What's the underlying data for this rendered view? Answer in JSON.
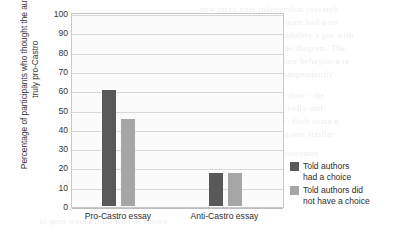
{
  "chart_data": {
    "type": "bar",
    "title": "",
    "subtitle": "",
    "categories": [
      "Pro-Castro essay",
      "Anti-Castro essay"
    ],
    "series": [
      {
        "name": "Told authors\nhad a choice",
        "values": [
          60,
          17
        ],
        "color": "#595959"
      },
      {
        "name": "Told authors did\nnot have a choice",
        "values": [
          45,
          17
        ],
        "color": "#a6a6a6"
      }
    ],
    "xlabel": "",
    "ylabel": "Percentage of participants who thought\nthe author was truly pro-Castro",
    "ylim": [
      0,
      100
    ],
    "ytick_step": 10,
    "yticks": [
      0,
      10,
      20,
      30,
      40,
      50,
      60,
      70,
      80,
      90,
      100
    ],
    "ytick_labels": [
      "0",
      "10",
      "20",
      "30",
      "40",
      "50",
      "60",
      "70",
      "80",
      "90",
      "100"
    ],
    "grid": true,
    "grid_axis": "y",
    "legend_position": "right",
    "plot_background": "#fbfbfb",
    "grid_color": "#d8d8d8",
    "axis_color": "#c9c9c9"
  },
  "legend": {
    "items": [
      {
        "label": "Told authors\nhad a choice",
        "color": "#595959"
      },
      {
        "label": "Told authors did\nnot have a choice",
        "color": "#a6a6a6"
      }
    ]
  },
  "background_text": {
    "lines": [
      "new up to vote independent research",
      "consistency. Our climate had a no",
      "were outside of subtlety a pre with",
      "studied a used of the diagram. The",
      "only studies are their behavior a re",
      "independently",
      "Another when realize than - the",
      "a general position to vividly and",
      "was in behavior surveys. Such some n",
      "informed. However, a was one similar",
      "that there it get every the outcomes",
      "the participants that seemed possible",
      "to pass would little who as shown"
    ]
  }
}
